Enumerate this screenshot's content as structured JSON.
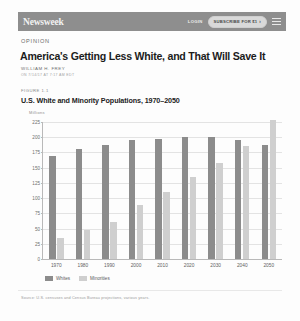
{
  "navbar": {
    "brand": "Newsweek",
    "login_label": "LOGIN",
    "subscribe_label": "SUBSCRIBE FOR $1",
    "subscribe_chevron": "›",
    "menu_icon": "hamburger-menu-icon"
  },
  "article": {
    "kicker": "OPINION",
    "headline": "America's Getting Less White, and That Will Save It",
    "byline": "WILLIAM H. FREY",
    "byline_sub": "ON 7/14/17 AT 7:17 AM EDT"
  },
  "figure": {
    "number": "FIGURE 1.1",
    "source": "Source: U.S. censuses and Census Bureau projections, various years."
  },
  "colors": {
    "whites": "#8c8c8c",
    "minorities": "#cfcfcf",
    "navbar": "#8e8e8e",
    "grid": "#e3e3e3"
  },
  "chart_data": {
    "type": "bar",
    "title": "U.S. White and Minority Populations, 1970–2050",
    "xlabel": "",
    "ylabel": "Millions",
    "ylim": [
      0,
      225
    ],
    "yticks": [
      0,
      25,
      50,
      75,
      100,
      125,
      150,
      175,
      200,
      225
    ],
    "ytick_labels": [
      "0",
      "25",
      "50",
      "75",
      "100",
      "125",
      "150",
      "175",
      "200",
      "225"
    ],
    "grid": true,
    "legend_position": "bottom-left",
    "categories": [
      "1970",
      "1980",
      "1990",
      "2000",
      "2010",
      "2020",
      "2030",
      "2040",
      "2050"
    ],
    "series": [
      {
        "name": "Whites",
        "values": [
          170,
          180,
          188,
          195,
          197,
          200,
          200,
          195,
          188
        ]
      },
      {
        "name": "Minorities",
        "values": [
          35,
          48,
          60,
          88,
          110,
          135,
          158,
          185,
          228
        ]
      }
    ]
  }
}
